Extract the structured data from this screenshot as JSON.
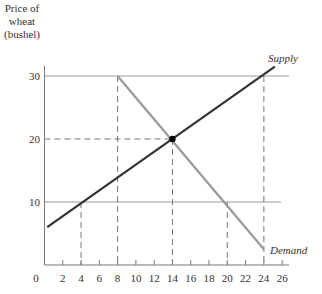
{
  "chart_data": {
    "type": "line",
    "title": "",
    "ylabel_lines": [
      "Price of",
      "wheat",
      "(bushel)"
    ],
    "xlabel": "",
    "x_ticks": [
      0,
      2,
      4,
      6,
      8,
      10,
      12,
      14,
      16,
      18,
      20,
      22,
      24,
      26
    ],
    "y_ticks": [
      10,
      20,
      30
    ],
    "xlim": [
      0,
      27
    ],
    "ylim": [
      0,
      35
    ],
    "horizontal_lines": [
      10,
      30
    ],
    "series": [
      {
        "name": "Supply",
        "x": [
          0.3,
          25.2
        ],
        "y": [
          6,
          31.5
        ],
        "color": "#333333"
      },
      {
        "name": "Demand",
        "x": [
          8,
          24
        ],
        "y": [
          30,
          2.5
        ],
        "color": "#999999"
      }
    ],
    "equilibrium": {
      "x": 14,
      "y": 20
    },
    "dashed_guides": [
      {
        "x": 4,
        "y": 10
      },
      {
        "x": 8,
        "y": 30
      },
      {
        "x": 14,
        "y": 20
      },
      {
        "x": 20,
        "y": 10
      },
      {
        "x": 24,
        "y": 30
      }
    ]
  }
}
